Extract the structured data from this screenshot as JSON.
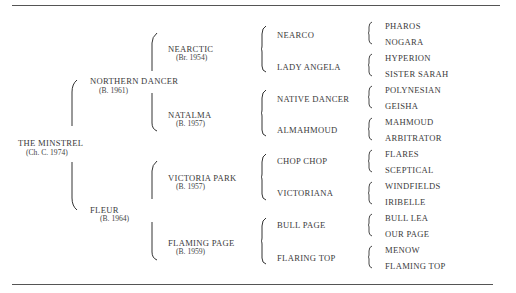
{
  "pedigree": {
    "subject": {
      "name": "THE MINSTREL",
      "detail": "(Ch. C. 1974)"
    },
    "parents": [
      {
        "name": "NORTHERN DANCER",
        "detail": "(B. 1961)"
      },
      {
        "name": "FLEUR",
        "detail": "(B. 1964)"
      }
    ],
    "grandparents": [
      {
        "name": "NEARCTIC",
        "detail": "(Br. 1954)"
      },
      {
        "name": "NATALMA",
        "detail": "(B. 1957)"
      },
      {
        "name": "VICTORIA PARK",
        "detail": "(B. 1957)"
      },
      {
        "name": "FLAMING PAGE",
        "detail": "(B. 1959)"
      }
    ],
    "great_grandparents": [
      "NEARCO",
      "LADY ANGELA",
      "NATIVE DANCER",
      "ALMAHMOUD",
      "CHOP CHOP",
      "VICTORIANA",
      "BULL PAGE",
      "FLARING TOP"
    ],
    "great_great_grandparents": [
      "PHAROS",
      "NOGARA",
      "HYPERION",
      "SISTER SARAH",
      "POLYNESIAN",
      "GEISHA",
      "MAHMOUD",
      "ARBITRATOR",
      "FLARES",
      "SCEPTICAL",
      "WINDFIELDS",
      "IRIBELLE",
      "BULL LEA",
      "OUR PAGE",
      "MENOW",
      "FLAMING TOP"
    ]
  }
}
